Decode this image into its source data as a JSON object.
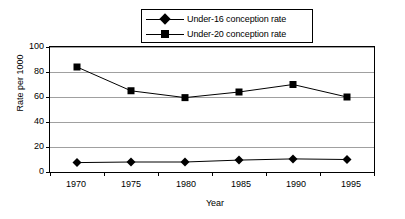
{
  "chart_data": {
    "type": "line",
    "title": "",
    "xlabel": "Year",
    "ylabel": "Rate per 1000",
    "categories": [
      "1970",
      "1975",
      "1980",
      "1985",
      "1990",
      "1995"
    ],
    "ylim": [
      0,
      100
    ],
    "yticks": [
      "0",
      "20",
      "40",
      "60",
      "80",
      "100"
    ],
    "grid": true,
    "legend_position": "top-center",
    "series": [
      {
        "name": "Under-16 conception rate",
        "marker": "diamond",
        "color": "#000000",
        "values": [
          7.5,
          8,
          8,
          9.5,
          10.5,
          10
        ]
      },
      {
        "name": "Under-20 conception rate",
        "marker": "square",
        "color": "#000000",
        "values": [
          84,
          65,
          59.5,
          64,
          70,
          60
        ]
      }
    ]
  },
  "legend": {
    "items": [
      {
        "label": "Under-16 conception rate",
        "marker": "diamond"
      },
      {
        "label": "Under-20 conception rate",
        "marker": "square"
      }
    ]
  },
  "axes": {
    "y_title": "Rate per 1000",
    "x_title": "Year",
    "y_ticks": [
      "100",
      "80",
      "60",
      "40",
      "20",
      "0"
    ],
    "x_ticks": [
      "1970",
      "1975",
      "1980",
      "1985",
      "1990",
      "1995"
    ]
  }
}
